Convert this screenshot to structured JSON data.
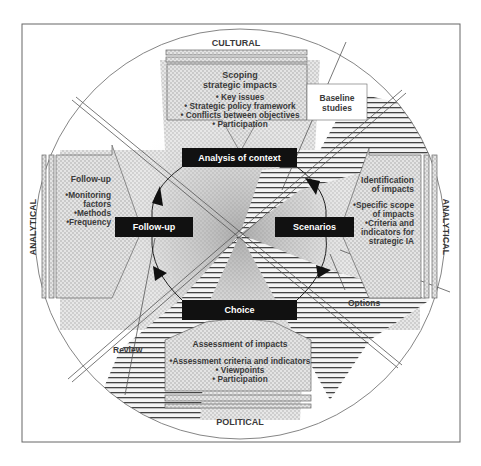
{
  "diagram": {
    "dimensions": {
      "top": "CULTURAL",
      "bottom": "POLITICAL",
      "left": "ANALYTICAL",
      "right": "ANALYTICAL"
    },
    "stages": {
      "analysis": "Analysis of context",
      "follow_up": "Follow-up",
      "scenarios": "Scenarios",
      "choice": "Choice"
    },
    "callouts": {
      "top": {
        "title_line1": "Scoping",
        "title_line2": "strategic impacts",
        "bullets": [
          "Key issues",
          "Strategic policy framework",
          "Conflicts between objectives",
          "Participation"
        ]
      },
      "left": {
        "title": "Follow-up",
        "bullets": [
          "Monitoring",
          "factors",
          "Methods",
          "Frequency"
        ]
      },
      "right": {
        "title_line1": "Identification",
        "title_line2": "of impacts",
        "bullets": [
          "Specific scope",
          "of impacts",
          "Criteria and",
          "indicators for",
          "strategic IA"
        ]
      },
      "bottom": {
        "title": "Assessment of impacts",
        "bullets": [
          "Assessment criteria and indicators",
          "Viewpoints",
          "Participation"
        ]
      }
    },
    "sector_labels": {
      "top_right": [
        "Baseline",
        "studies"
      ],
      "bottom_right": "Options",
      "bottom_left": "Review"
    },
    "bullet_glyph": "•",
    "colors": {
      "stage_box": "#111111",
      "stroke": "#555555",
      "screen": "#cfcfcf",
      "text": "#3a3a3a"
    }
  }
}
